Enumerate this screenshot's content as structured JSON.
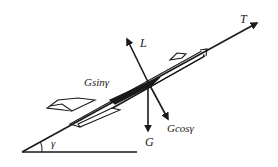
{
  "diagram": {
    "labels": {
      "thrust": "T",
      "lift": "L",
      "weight": "G",
      "weight_parallel": "Gsinγ",
      "weight_perpendicular": "Gcosγ",
      "climb_angle": "γ"
    },
    "colors": {
      "stroke": "#1a1a1a",
      "background": "#ffffff"
    }
  }
}
